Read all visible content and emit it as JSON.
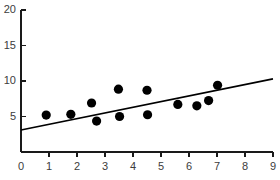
{
  "chart_data": {
    "type": "scatter",
    "title": "",
    "subtitle": "",
    "xlabel": "",
    "ylabel": "",
    "xlim": [
      0,
      9
    ],
    "ylim": [
      0,
      20
    ],
    "grid": false,
    "legend": null,
    "legend_position": "none",
    "x_ticks": [
      0,
      1,
      2,
      3,
      4,
      5,
      6,
      7,
      8,
      9
    ],
    "x_tick_labels": [
      "0",
      "1",
      "2",
      "3",
      "4",
      "5",
      "6",
      "7",
      "8",
      "9"
    ],
    "y_ticks": [
      5,
      10,
      15,
      20
    ],
    "y_tick_labels": [
      "5",
      "10",
      "15",
      "20"
    ],
    "marker_color": "#000000",
    "marker_size": 4.6,
    "line_color": "#000000",
    "axis_color": "#1a1a1a",
    "tick_label_color": "#3c3c3c",
    "background_color": "#ffffff",
    "points": [
      {
        "x": 0.9,
        "y": 5.2
      },
      {
        "x": 1.78,
        "y": 5.3
      },
      {
        "x": 2.52,
        "y": 6.9
      },
      {
        "x": 2.7,
        "y": 4.35
      },
      {
        "x": 3.48,
        "y": 8.85
      },
      {
        "x": 3.52,
        "y": 5.0
      },
      {
        "x": 4.5,
        "y": 8.7
      },
      {
        "x": 4.52,
        "y": 5.25
      },
      {
        "x": 5.6,
        "y": 6.7
      },
      {
        "x": 6.28,
        "y": 6.5
      },
      {
        "x": 6.7,
        "y": 7.25
      },
      {
        "x": 7.02,
        "y": 9.4
      }
    ],
    "series": [
      {
        "name": "observations",
        "type": "scatter",
        "x": [
          0.9,
          1.78,
          2.52,
          2.7,
          3.48,
          3.52,
          4.5,
          4.52,
          5.6,
          6.28,
          6.7,
          7.02
        ],
        "values": [
          5.2,
          5.3,
          6.9,
          4.35,
          8.85,
          5.0,
          8.7,
          5.25,
          6.7,
          6.5,
          7.25,
          9.4
        ]
      },
      {
        "name": "trend-line",
        "type": "line",
        "x": [
          0,
          9
        ],
        "values": [
          3.1,
          10.3
        ],
        "slope": 0.8,
        "intercept": 3.1
      }
    ]
  }
}
